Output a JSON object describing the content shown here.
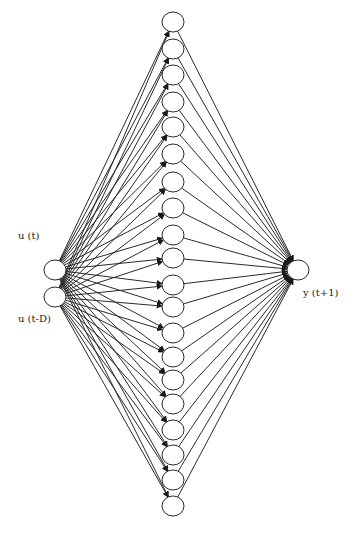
{
  "diagram": {
    "title": "",
    "type": "feed-forward neural network",
    "colors": {
      "stroke": "#2a2a2a",
      "node_fill": "#ffffff",
      "background": "#ffffff"
    },
    "input_layer": {
      "nodes": [
        {
          "id": "in1",
          "label": "u (t)",
          "cx": 55,
          "cy": 270,
          "label_x": 18,
          "label_y": 236
        },
        {
          "id": "in2",
          "label": "u (t-D)",
          "cx": 55,
          "cy": 297,
          "label_x": 18,
          "label_y": 319
        }
      ]
    },
    "hidden_layer": {
      "count": 20,
      "cx": 173,
      "cy": [
        22,
        49,
        75,
        102,
        127,
        154,
        182,
        208,
        235,
        258,
        285,
        307,
        333,
        357,
        380,
        404,
        430,
        455,
        480,
        506
      ]
    },
    "output_layer": {
      "nodes": [
        {
          "id": "out1",
          "label": "y (t+1)",
          "cx": 298,
          "cy": 270,
          "label_x": 303,
          "label_y": 293
        }
      ]
    },
    "node_rx": 11,
    "node_ry": 10
  }
}
